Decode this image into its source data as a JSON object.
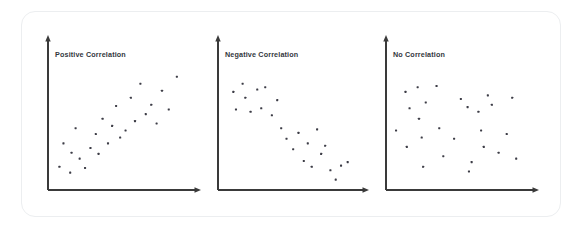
{
  "figure": {
    "background_color": "#ffffff",
    "card": {
      "border_color": "#eceef0",
      "background_color": "#ffffff",
      "corner_radius": 14
    },
    "axis_color": "#3a3a3a",
    "point_color": "#3c3c46",
    "label_color": "#33373d"
  },
  "chart_data": [
    {
      "type": "scatter",
      "title": "Positive Correlation",
      "xlabel": "",
      "ylabel": "",
      "xlim": [
        0,
        100
      ],
      "ylim": [
        0,
        100
      ],
      "grid": false,
      "legend": "none",
      "axis_arrows": true,
      "points": [
        [
          4,
          13
        ],
        [
          7,
          33
        ],
        [
          12,
          8
        ],
        [
          13,
          25
        ],
        [
          16,
          46
        ],
        [
          19,
          20
        ],
        [
          23,
          12
        ],
        [
          27,
          29
        ],
        [
          31,
          41
        ],
        [
          33,
          24
        ],
        [
          36,
          54
        ],
        [
          40,
          33
        ],
        [
          43,
          48
        ],
        [
          46,
          65
        ],
        [
          49,
          38
        ],
        [
          53,
          44
        ],
        [
          57,
          72
        ],
        [
          60,
          52
        ],
        [
          64,
          84
        ],
        [
          68,
          58
        ],
        [
          72,
          66
        ],
        [
          76,
          50
        ],
        [
          80,
          78
        ],
        [
          85,
          62
        ],
        [
          91,
          90
        ]
      ]
    },
    {
      "type": "scatter",
      "title": "Negative Correlation",
      "xlabel": "",
      "ylabel": "",
      "xlim": [
        0,
        100
      ],
      "ylim": [
        0,
        100
      ],
      "grid": false,
      "legend": "none",
      "axis_arrows": true,
      "points": [
        [
          7,
          77
        ],
        [
          9,
          62
        ],
        [
          14,
          84
        ],
        [
          16,
          72
        ],
        [
          20,
          60
        ],
        [
          25,
          79
        ],
        [
          28,
          63
        ],
        [
          31,
          81
        ],
        [
          36,
          57
        ],
        [
          40,
          70
        ],
        [
          43,
          46
        ],
        [
          47,
          37
        ],
        [
          52,
          28
        ],
        [
          56,
          42
        ],
        [
          60,
          18
        ],
        [
          63,
          33
        ],
        [
          66,
          13
        ],
        [
          70,
          45
        ],
        [
          73,
          24
        ],
        [
          76,
          31
        ],
        [
          80,
          10
        ],
        [
          84,
          2
        ],
        [
          88,
          14
        ],
        [
          93,
          17
        ]
      ]
    },
    {
      "type": "scatter",
      "title": "No Correlation",
      "xlabel": "",
      "ylabel": "",
      "xlim": [
        0,
        100
      ],
      "ylim": [
        0,
        100
      ],
      "grid": false,
      "legend": "none",
      "axis_arrows": true,
      "points": [
        [
          3,
          44
        ],
        [
          10,
          77
        ],
        [
          11,
          30
        ],
        [
          13,
          63
        ],
        [
          19,
          81
        ],
        [
          20,
          54
        ],
        [
          22,
          38
        ],
        [
          23,
          13
        ],
        [
          25,
          68
        ],
        [
          33,
          82
        ],
        [
          35,
          46
        ],
        [
          38,
          22
        ],
        [
          46,
          37
        ],
        [
          51,
          71
        ],
        [
          56,
          64
        ],
        [
          57,
          9
        ],
        [
          59,
          17
        ],
        [
          64,
          60
        ],
        [
          66,
          44
        ],
        [
          68,
          30
        ],
        [
          71,
          74
        ],
        [
          74,
          66
        ],
        [
          79,
          25
        ],
        [
          85,
          41
        ],
        [
          89,
          72
        ],
        [
          92,
          20
        ]
      ]
    }
  ],
  "layout": {
    "panels": [
      {
        "x_origin": 48,
        "y_origin": 190,
        "x_end": 201,
        "y_top": 35,
        "label_x": 55,
        "label_y": 57
      },
      {
        "x_origin": 218,
        "y_origin": 190,
        "x_end": 369,
        "y_top": 35,
        "label_x": 225,
        "label_y": 57
      },
      {
        "x_origin": 386,
        "y_origin": 190,
        "x_end": 539,
        "y_top": 35,
        "label_x": 393,
        "label_y": 57
      }
    ],
    "plot_inset": {
      "left": 6,
      "right": 12,
      "top": 30,
      "bottom": 8
    },
    "point_size": 2.1
  }
}
